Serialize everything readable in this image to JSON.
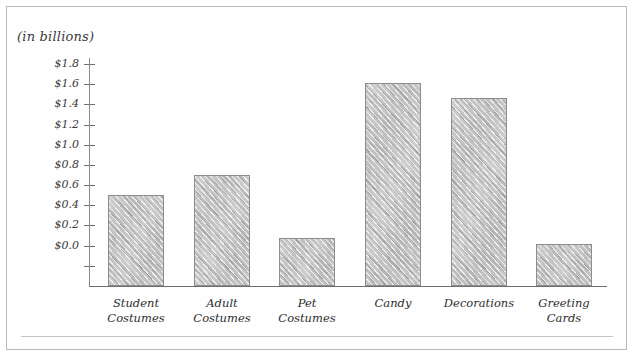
{
  "chart_data": {
    "type": "bar",
    "title": "(in billions)",
    "xlabel": "",
    "ylabel": "(in billions)",
    "categories": [
      "Student\nCostumes",
      "Adult\nCostumes",
      "Pet\nCostumes",
      "Candy",
      "Decorations",
      "Greeting\nCards"
    ],
    "category_lines": [
      [
        "Student",
        "Costumes"
      ],
      [
        "Adult",
        "Costumes"
      ],
      [
        "Pet",
        "Costumes"
      ],
      [
        "Candy",
        ""
      ],
      [
        "Decorations",
        ""
      ],
      [
        "Greeting",
        "Cards"
      ]
    ],
    "values": [
      0.5,
      0.7,
      0.08,
      1.61,
      1.46,
      0.02
    ],
    "ylim": [
      -0.4,
      1.9
    ],
    "ytick_values": [
      0.0,
      0.2,
      0.4,
      0.6,
      0.8,
      1.0,
      1.2,
      1.4,
      1.6,
      1.8
    ],
    "ytick_labels": [
      "$0.0",
      "$0.2",
      "$0.4",
      "$0.6",
      "$0.8",
      "$1.0",
      "$1.2",
      "$1.4",
      "$1.6",
      "$1.8"
    ],
    "unlabeled_ticks_below_zero": [
      -0.2
    ],
    "grid": false,
    "legend": null,
    "style": "hand-drawn pencil sketch"
  },
  "colors": {
    "bar_fill": "#c8c8c8",
    "bar_stroke": "#8d8d8d",
    "axis": "#6e6e6e",
    "text": "#2f2f2f",
    "frame": "#b9b9b9"
  }
}
